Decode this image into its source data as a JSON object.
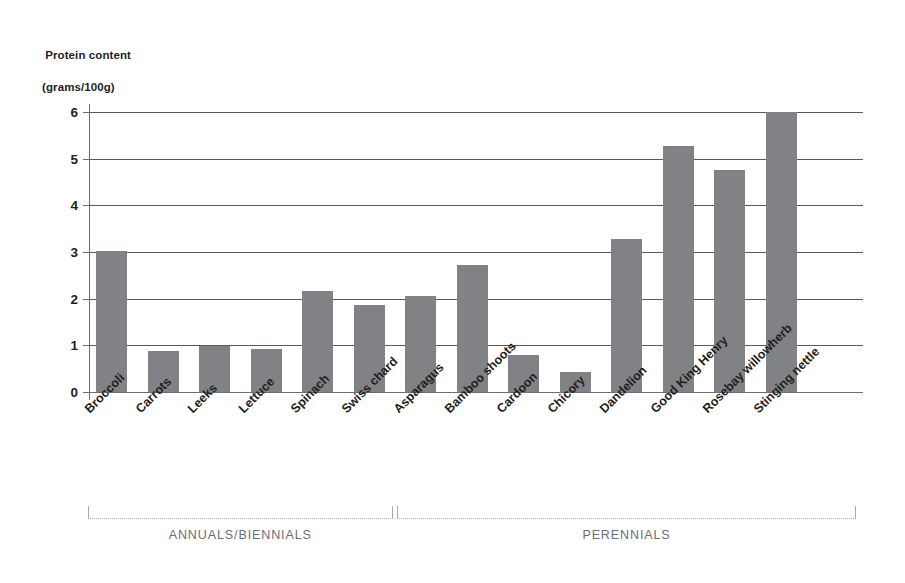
{
  "axis_title": {
    "line1": "Protein content",
    "line2": "(grams/100g)"
  },
  "colors": {
    "bar": "#808285",
    "gridline": "#58595b",
    "axis": "#6d6e71",
    "bracket": "#a7a9ac",
    "text": "#231f20",
    "background": "#ffffff"
  },
  "brackets": [
    {
      "label": "ANNUALS/BIENNIALS",
      "start_index": 0,
      "end_index": 5
    },
    {
      "label": "PERENNIALS",
      "start_index": 6,
      "end_index": 14
    }
  ],
  "chart_data": {
    "type": "bar",
    "title": "",
    "subtitle": "",
    "xlabel": "",
    "ylabel": "Protein content (grams/100g)",
    "ylim": [
      0,
      6
    ],
    "yticks": [
      0,
      1,
      2,
      3,
      4,
      5,
      6
    ],
    "ytick_labels": [
      "0",
      "1",
      "2",
      "3",
      "4",
      "5",
      "6"
    ],
    "grid": true,
    "legend": false,
    "legend_position": "none",
    "categories": [
      "Broccoli",
      "Carrots",
      "Leeks",
      "Lettuce",
      "Spinach",
      "Swiss chard",
      "Asparagus",
      "Bamboo shoots",
      "Cardoon",
      "Chicory",
      "Dandelion",
      "Good King Henry",
      "Rosebay willowherb",
      "Stinging nettle"
    ],
    "values": [
      3.02,
      0.87,
      0.99,
      0.93,
      2.17,
      1.86,
      2.05,
      2.73,
      0.8,
      0.42,
      3.28,
      5.28,
      4.75,
      6.0
    ],
    "annotations": [
      "ANNUALS/BIENNIALS",
      "PERENNIALS"
    ]
  }
}
